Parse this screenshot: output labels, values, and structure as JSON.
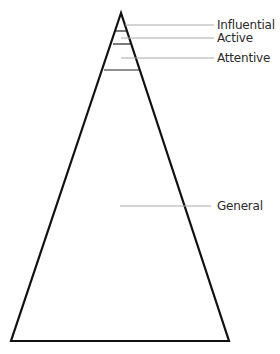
{
  "diagram": {
    "type": "pyramid",
    "title": "",
    "levels": [
      {
        "name": "Influential",
        "order": 1
      },
      {
        "name": "Active",
        "order": 2
      },
      {
        "name": "Attentive",
        "order": 3
      },
      {
        "name": "General",
        "order": 4
      }
    ],
    "colors": {
      "outline": "#111111",
      "leader_line": "#aaaaaa",
      "text": "#2a2a2a",
      "background": "#ffffff"
    }
  }
}
